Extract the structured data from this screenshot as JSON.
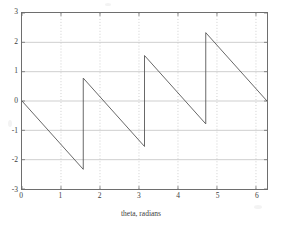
{
  "figure": {
    "background_color": "#ffffff",
    "axes_color": "#6e6e6e",
    "grid_color": "#b9b9b9",
    "line_color": "#555555"
  },
  "chart_data": {
    "type": "line",
    "title": "",
    "subtitle": "",
    "xlabel": "theta, radians",
    "ylabel": "",
    "xlim": [
      0,
      6.2832
    ],
    "ylim": [
      -3,
      3
    ],
    "grid": true,
    "grid_style": "dotted",
    "legend": null,
    "legend_position": "none",
    "xticks": [
      0,
      1,
      2,
      3,
      4,
      5,
      6
    ],
    "xtick_labels": [
      "0",
      "1",
      "2",
      "3",
      "4",
      "5",
      "6"
    ],
    "yticks": [
      -3,
      -2,
      -1,
      0,
      1,
      2,
      3
    ],
    "ytick_labels": [
      "-3",
      "-2",
      "-1",
      "0",
      "1",
      "2",
      "3"
    ],
    "series": [
      {
        "name": "sawtooth phase",
        "segments": [
          {
            "x": [
              0.0,
              1.5708
            ],
            "y": [
              0.0,
              -2.33
            ]
          },
          {
            "x": [
              1.5708,
              1.5708
            ],
            "y": [
              -2.33,
              0.78
            ]
          },
          {
            "x": [
              1.5708,
              3.1416
            ],
            "y": [
              0.78,
              -1.55
            ]
          },
          {
            "x": [
              3.1416,
              3.1416
            ],
            "y": [
              -1.55,
              1.55
            ]
          },
          {
            "x": [
              3.1416,
              4.7124
            ],
            "y": [
              1.55,
              -0.78
            ]
          },
          {
            "x": [
              4.7124,
              4.7124
            ],
            "y": [
              -0.78,
              2.33
            ]
          },
          {
            "x": [
              4.7124,
              6.2832
            ],
            "y": [
              2.33,
              0.0
            ]
          }
        ],
        "discontinuities": [
          1.5708,
          3.1416,
          4.7124
        ],
        "peaks": [
          0.78,
          1.55,
          2.33
        ],
        "valleys": [
          -2.33,
          -1.55,
          -0.78
        ],
        "start_point": [
          0.0,
          0.0
        ],
        "end_point": [
          6.2832,
          0.0
        ]
      }
    ]
  }
}
